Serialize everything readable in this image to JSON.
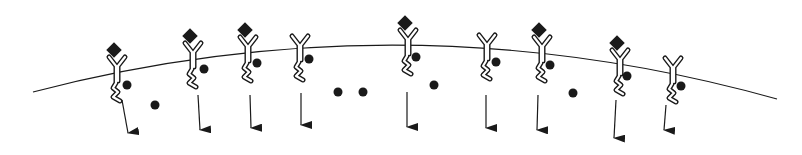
{
  "diagram": {
    "colors": {
      "stroke": "#1a1a1a",
      "fill": "#1a1a1a",
      "background": "#ffffff",
      "receptor_fill": "#ffffff"
    },
    "membrane": {
      "start": [
        33,
        92
      ],
      "control": [
        405,
        -5
      ],
      "end": [
        777,
        99
      ]
    },
    "receptors": [
      {
        "x": 117,
        "top": 57,
        "bound": true,
        "dot": [
          127,
          85
        ],
        "arrow": [
          [
            122,
            100
          ],
          [
            128,
            133
          ]
        ]
      },
      {
        "x": 193,
        "top": 43,
        "bound": true,
        "dot": [
          204,
          69
        ],
        "arrow": [
          [
            198,
            95
          ],
          [
            200,
            130
          ]
        ]
      },
      {
        "x": 248,
        "top": 37,
        "bound": true,
        "dot": [
          257,
          63
        ],
        "arrow": [
          [
            250,
            95
          ],
          [
            251,
            128
          ]
        ]
      },
      {
        "x": 300,
        "top": 36,
        "bound": false,
        "dot": [
          309,
          59
        ],
        "arrow": [
          [
            301,
            93
          ],
          [
            301,
            125
          ]
        ]
      },
      {
        "x": 408,
        "top": 30,
        "bound": true,
        "dot": [
          416,
          57
        ],
        "arrow": [
          [
            407,
            92
          ],
          [
            407,
            127
          ]
        ]
      },
      {
        "x": 487,
        "top": 35,
        "bound": false,
        "dot": [
          496,
          62
        ],
        "arrow": [
          [
            486,
            95
          ],
          [
            486,
            128
          ]
        ]
      },
      {
        "x": 542,
        "top": 37,
        "bound": true,
        "dot": [
          550,
          65
        ],
        "arrow": [
          [
            538,
            95
          ],
          [
            537,
            130
          ]
        ]
      },
      {
        "x": 620,
        "top": 50,
        "bound": true,
        "dot": [
          627,
          76
        ],
        "arrow": [
          [
            616,
            100
          ],
          [
            614,
            138
          ]
        ]
      },
      {
        "x": 673,
        "top": 58,
        "bound": false,
        "dot": [
          681,
          86
        ],
        "arrow": [
          [
            666,
            105
          ],
          [
            664,
            130
          ]
        ]
      }
    ],
    "free_dots": [
      [
        155,
        105
      ],
      [
        338,
        92
      ],
      [
        363,
        92
      ],
      [
        434,
        85
      ],
      [
        573,
        93
      ]
    ]
  }
}
